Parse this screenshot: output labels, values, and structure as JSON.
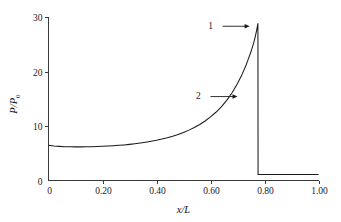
{
  "chart_data": {
    "type": "line",
    "title": "",
    "xlabel": "x/L",
    "ylabel": "P/P0",
    "ylabel_main": "P/P",
    "ylabel_sub": "0",
    "xlim": [
      0,
      1.0
    ],
    "ylim": [
      0,
      30
    ],
    "grid": false,
    "legend": "none",
    "xticks": [
      0,
      0.2,
      0.4,
      0.6,
      0.8,
      1.0
    ],
    "xtick_labels": [
      "0",
      "0.20",
      "0.40",
      "0.60",
      "0.80",
      "1.00"
    ],
    "yticks": [
      0,
      10,
      20,
      30
    ],
    "ytick_labels": [
      "0",
      "10",
      "20",
      "30"
    ],
    "series": [
      {
        "name": "pressure-ratio-profile",
        "shock_position": 0.775,
        "peak_value": 28.8,
        "post_shock_value": 1.1,
        "x": [
          0.0,
          0.02,
          0.04,
          0.06,
          0.08,
          0.1,
          0.12,
          0.14,
          0.16,
          0.18,
          0.2,
          0.22,
          0.24,
          0.26,
          0.28,
          0.3,
          0.32,
          0.34,
          0.36,
          0.38,
          0.4,
          0.42,
          0.44,
          0.46,
          0.48,
          0.5,
          0.52,
          0.54,
          0.56,
          0.58,
          0.6,
          0.62,
          0.64,
          0.66,
          0.68,
          0.7,
          0.715,
          0.73,
          0.742,
          0.752,
          0.76,
          0.766,
          0.77,
          0.773,
          0.7745,
          0.7752,
          0.7756,
          0.7758,
          0.776,
          0.7762,
          0.8,
          0.85,
          0.9,
          0.95,
          1.0
        ],
        "y": [
          6.45,
          6.33,
          6.26,
          6.21,
          6.18,
          6.17,
          6.17,
          6.18,
          6.2,
          6.23,
          6.27,
          6.32,
          6.38,
          6.45,
          6.53,
          6.63,
          6.74,
          6.87,
          7.02,
          7.19,
          7.38,
          7.6,
          7.85,
          8.13,
          8.45,
          8.82,
          9.24,
          9.72,
          10.28,
          10.92,
          11.66,
          12.52,
          13.52,
          14.7,
          16.1,
          17.8,
          19.25,
          20.95,
          22.55,
          23.95,
          25.25,
          26.45,
          27.35,
          28.1,
          28.5,
          28.7,
          28.8,
          20.0,
          8.0,
          1.1,
          1.1,
          1.1,
          1.1,
          1.1,
          1.1
        ]
      }
    ],
    "annotations": [
      {
        "label": "1",
        "target": "shock-spike-peak",
        "label_x": 0.6,
        "label_y": 28.5,
        "arrow_from_x": 0.645,
        "arrow_from_y": 28.3,
        "arrow_to_x": 0.745,
        "arrow_to_y": 28.3
      },
      {
        "label": "2",
        "target": "subsonic-pressure-curve",
        "label_x": 0.555,
        "label_y": 15.6,
        "arrow_from_x": 0.6,
        "arrow_from_y": 15.4,
        "arrow_to_x": 0.7,
        "arrow_to_y": 15.4
      }
    ],
    "colors": {
      "curve": "#1b1b1b",
      "axis": "#3a3a3a",
      "text": "#1a1a1a",
      "background": "#ffffff"
    }
  }
}
